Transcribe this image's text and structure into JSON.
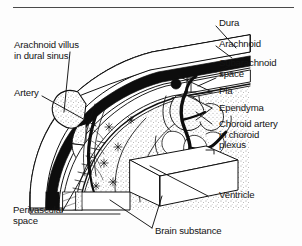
{
  "figure": {
    "type": "anatomical-line-diagram",
    "width": 302,
    "height": 246,
    "background_color": "#fdfdfd",
    "ink_color": "#141414",
    "rule_color": "#4a4a4a"
  },
  "labels": {
    "arachnoid_villus": "Arachnoid villus\nin dural sinus",
    "artery": "Artery",
    "perivascular_space": "Perivascular\nspace",
    "brain_substance": "Brain substance",
    "dura": "Dura",
    "arachnoid": "Arachnoid",
    "subarachnoid_space": "Subarachnoid\nspace",
    "pia": "Pia",
    "ependyma": "Ependyma",
    "choroid_artery": "Choroid artery\nin choroid\nplexus",
    "ventricle": "Ventricle"
  },
  "structures": [
    {
      "name": "dural-sinus",
      "fill": "white",
      "outline": "black"
    },
    {
      "name": "arachnoid-villus-bulb",
      "fill": "stipple",
      "outline": "black"
    },
    {
      "name": "dura-mater-layer",
      "fill": "solid-black",
      "outline": "black"
    },
    {
      "name": "arachnoid-membrane",
      "fill": "white",
      "outline": "black"
    },
    {
      "name": "subarachnoid-space",
      "fill": "white",
      "outline": "black"
    },
    {
      "name": "pia-mater",
      "fill": "black-line",
      "outline": "black"
    },
    {
      "name": "brain-substance",
      "fill": "stipple",
      "outline": "black"
    },
    {
      "name": "ventricle-block",
      "fill": "white",
      "outline": "black"
    },
    {
      "name": "choroid-plexus",
      "fill": "stipple",
      "outline": "black"
    },
    {
      "name": "choroid-artery",
      "fill": "solid-black",
      "outline": "black"
    },
    {
      "name": "cortical-artery",
      "fill": "solid-black",
      "outline": "black"
    },
    {
      "name": "astrocytes",
      "fill": "black",
      "outline": "black"
    }
  ]
}
